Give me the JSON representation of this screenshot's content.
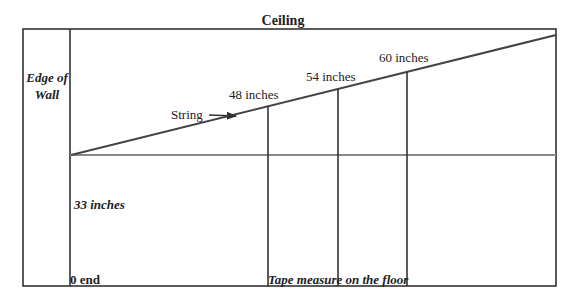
{
  "diagram": {
    "title": "Ceiling",
    "wall_label_line1": "Edge of",
    "wall_label_line2": "Wall",
    "string_label": "String",
    "height_label": "33 inches",
    "zero_label": "0 end",
    "floor_label": "Tape measure on the floor",
    "measurements": [
      {
        "label": "48 inches",
        "value": 48
      },
      {
        "label": "54 inches",
        "value": 54
      },
      {
        "label": "60 inches",
        "value": 60
      }
    ],
    "colors": {
      "line": "#333333",
      "baseline": "#888888",
      "text": "#222222",
      "background": "#ffffff"
    }
  }
}
